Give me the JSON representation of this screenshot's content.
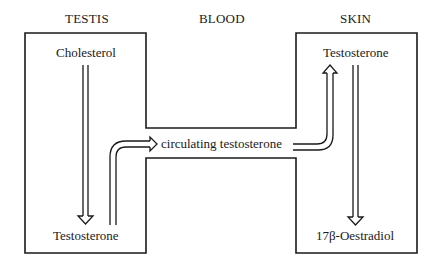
{
  "headers": {
    "testis": "TESTIS",
    "blood": "BLOOD",
    "skin": "SKIN"
  },
  "testis": {
    "top_label": "Cholesterol",
    "bottom_label": "Testosterone"
  },
  "blood": {
    "flow_label": "circulating testosterone"
  },
  "skin": {
    "top_label": "Testosterone",
    "bottom_label": "17β-Oestradiol"
  },
  "colors": {
    "line": "#1a1a1a",
    "background": "#ffffff"
  }
}
